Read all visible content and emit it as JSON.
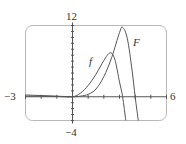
{
  "chart_data": {
    "type": "line",
    "title": "",
    "xlabel": "",
    "ylabel": "",
    "xlim": [
      -3,
      6
    ],
    "ylim": [
      -4,
      12
    ],
    "x_tick_labels": [
      "-3",
      "6"
    ],
    "y_tick_labels": [
      "12",
      "-4"
    ],
    "x_ticks": [
      -3,
      -2,
      -1,
      0,
      1,
      2,
      3,
      4,
      5,
      6
    ],
    "y_ticks": [
      -4,
      -3,
      -2,
      -1,
      0,
      1,
      2,
      3,
      4,
      5,
      6,
      7,
      8,
      9,
      10,
      11,
      12
    ],
    "grid": false,
    "legend": "inline labels",
    "series": [
      {
        "name": "f",
        "x": [
          -3,
          -2,
          -1,
          0,
          0.5,
          1,
          1.5,
          2,
          2.4,
          2.7,
          3.0,
          3.2,
          3.4
        ],
        "values": [
          0.1,
          0.1,
          0.05,
          0,
          0.6,
          1.9,
          3.8,
          6.1,
          7.4,
          6.3,
          2.5,
          0,
          -4
        ]
      },
      {
        "name": "F",
        "x": [
          -3,
          -2,
          -1,
          0,
          0.5,
          1,
          1.5,
          2,
          2.5,
          3,
          3.2,
          3.5,
          3.8,
          4.0,
          4.2
        ],
        "values": [
          0.3,
          0.2,
          0.1,
          0,
          0.1,
          0.4,
          1.3,
          3.4,
          6.6,
          10.8,
          11.7,
          9.8,
          4.5,
          0,
          -4
        ]
      }
    ],
    "annotations": [
      {
        "text": "f",
        "x": 1.2,
        "y": 5.5
      },
      {
        "text": "F",
        "x": 4.1,
        "y": 8.7
      }
    ]
  },
  "labels": {
    "x_min": "−3",
    "x_max": "6",
    "y_max": "12",
    "y_min": "−4",
    "f": "f",
    "F": "F"
  },
  "colors": {
    "frame": "#b8b8b8",
    "axis": "#555555",
    "curve": "#555555",
    "text": "#333333"
  }
}
